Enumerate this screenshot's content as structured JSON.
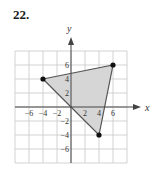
{
  "problem": {
    "number": "22."
  },
  "colors": {
    "grid": "#c8c8c8",
    "axis": "#444444",
    "fill": "#d6d6d6",
    "edge": "#555555",
    "point": "#111111"
  },
  "chart_data": {
    "type": "scatter",
    "title": "",
    "xlabel": "x",
    "ylabel": "y",
    "xlim": [
      -8,
      8
    ],
    "ylim": [
      -8,
      8
    ],
    "grid": true,
    "grid_step": 2,
    "x_ticks": [
      -6,
      -4,
      -2,
      2,
      4,
      6
    ],
    "y_ticks": [
      6,
      4,
      2,
      -2,
      -4,
      -6
    ],
    "polygon": {
      "name": "triangle",
      "filled": true,
      "vertices": [
        [
          -4,
          4
        ],
        [
          6,
          6
        ],
        [
          4,
          -4
        ]
      ]
    },
    "points": [
      [
        -4,
        4
      ],
      [
        6,
        6
      ],
      [
        4,
        -4
      ]
    ]
  }
}
